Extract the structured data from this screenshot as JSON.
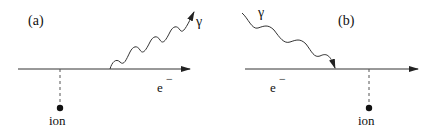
{
  "panels": [
    {
      "id": "a",
      "label": "(a)",
      "photon_label": "γ",
      "electron_label": "e",
      "electron_sup": "−",
      "ion_label": "ion",
      "description": "Photon emitted from electron line (bremsstrahlung)"
    },
    {
      "id": "b",
      "label": "(b)",
      "photon_label": "γ",
      "electron_label": "e",
      "electron_sup": "−",
      "ion_label": "ion",
      "description": "Photon absorbed by electron line (inverse bremsstrahlung)"
    }
  ],
  "colors": {
    "line": "#333333",
    "dashed": "#555555",
    "dot": "#111111"
  }
}
